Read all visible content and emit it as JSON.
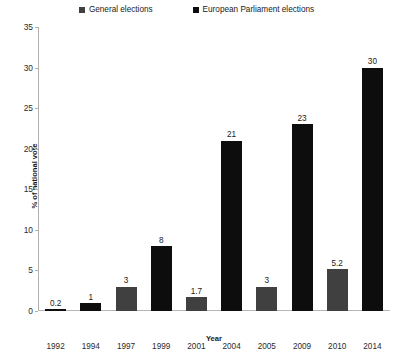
{
  "chart_data": {
    "type": "bar",
    "title": "",
    "xlabel": "Year",
    "ylabel": "% of national vote",
    "ylim": [
      0,
      35
    ],
    "ytick_values": [
      0,
      5,
      10,
      15,
      20,
      25,
      30,
      35
    ],
    "ytick_labels": [
      "0",
      "5",
      "10",
      "15",
      "20",
      "25",
      "30",
      "35"
    ],
    "grid": false,
    "legend_position": "top-center",
    "categories": [
      "1992",
      "1994",
      "1997",
      "1999",
      "2001",
      "2004",
      "2005",
      "2009",
      "2010",
      "2014"
    ],
    "series": [
      {
        "name": "General elections",
        "color": "#404040",
        "points": [
          {
            "category": "1997",
            "value": 3,
            "label": "3"
          },
          {
            "category": "2001",
            "value": 1.7,
            "label": "1.7"
          },
          {
            "category": "2005",
            "value": 3,
            "label": "3"
          },
          {
            "category": "2010",
            "value": 5.2,
            "label": "5.2"
          }
        ]
      },
      {
        "name": "European Parliament elections",
        "color": "#0d0d0d",
        "points": [
          {
            "category": "1992",
            "value": 0.2,
            "label": "0.2"
          },
          {
            "category": "1994",
            "value": 1,
            "label": "1"
          },
          {
            "category": "1999",
            "value": 8,
            "label": "8"
          },
          {
            "category": "2004",
            "value": 21,
            "label": "21"
          },
          {
            "category": "2009",
            "value": 23,
            "label": "23"
          },
          {
            "category": "2014",
            "value": 30,
            "label": "30"
          }
        ]
      }
    ],
    "bars": [
      {
        "category": "1992",
        "value": 0.2,
        "label": "0.2",
        "series": "European Parliament elections",
        "color": "#0d0d0d"
      },
      {
        "category": "1994",
        "value": 1,
        "label": "1",
        "series": "European Parliament elections",
        "color": "#0d0d0d"
      },
      {
        "category": "1997",
        "value": 3,
        "label": "3",
        "series": "General elections",
        "color": "#404040"
      },
      {
        "category": "1999",
        "value": 8,
        "label": "8",
        "series": "European Parliament elections",
        "color": "#0d0d0d"
      },
      {
        "category": "2001",
        "value": 1.7,
        "label": "1.7",
        "series": "General elections",
        "color": "#404040"
      },
      {
        "category": "2004",
        "value": 21,
        "label": "21",
        "series": "European Parliament elections",
        "color": "#0d0d0d"
      },
      {
        "category": "2005",
        "value": 3,
        "label": "3",
        "series": "General elections",
        "color": "#404040"
      },
      {
        "category": "2009",
        "value": 23,
        "label": "23",
        "series": "European Parliament elections",
        "color": "#0d0d0d"
      },
      {
        "category": "2010",
        "value": 5.2,
        "label": "5.2",
        "series": "General elections",
        "color": "#404040"
      },
      {
        "category": "2014",
        "value": 30,
        "label": "30",
        "series": "European Parliament elections",
        "color": "#0d0d0d"
      }
    ]
  },
  "legend": {
    "entries": [
      {
        "label": "General elections",
        "color": "#404040"
      },
      {
        "label": "European Parliament elections",
        "color": "#0d0d0d"
      }
    ]
  }
}
